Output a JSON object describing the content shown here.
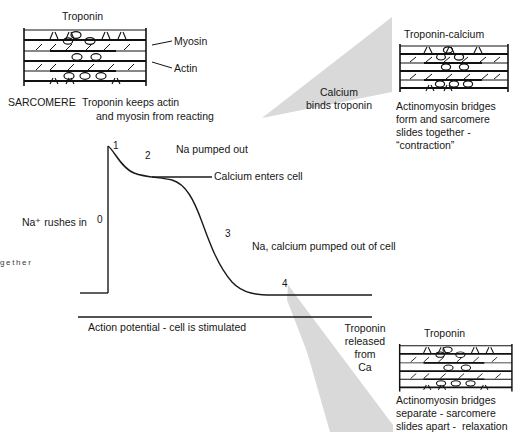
{
  "panels": {
    "top_left": {
      "name": "relaxed-sarcomere-panel",
      "heading": "Troponin",
      "label_myosin": "Myosin",
      "label_actin": "Actin",
      "caption_bold": "SARCOMERE",
      "caption_line1": "Troponin keeps actin",
      "caption_line2": "and myosin from reacting"
    },
    "top_right": {
      "name": "contracted-sarcomere-panel",
      "heading": "Troponin-calcium",
      "caption_line1": "Actinomyosin bridges",
      "caption_line2": "form and sarcomere",
      "caption_line3": "slides together -",
      "caption_line4": "“contraction”"
    },
    "bottom_right": {
      "name": "relaxing-sarcomere-panel",
      "heading": "Troponin",
      "caption_line1": "Actinomyosin bridges",
      "caption_line2": "separate - sarcomere",
      "caption_line3": "slides apart -  relaxation"
    }
  },
  "connectors": {
    "upper_label_line1": "Calcium",
    "upper_label_line2": "binds troponin",
    "lower_label_line1": "Troponin",
    "lower_label_line2": "released",
    "lower_label_line3": "from",
    "lower_label_line4": "Ca",
    "fill_color": "#d9d9d9"
  },
  "graph": {
    "name": "action-potential-graph",
    "axis_caption": "Action potential - cell is stimulated",
    "label_na_rushes_in": "Na⁺ rushes in",
    "label_na_pumped_out": "Na pumped out",
    "label_calcium_enters": "Calcium enters cell",
    "label_na_calcium_pumped_out": "Na, calcium pumped out of cell",
    "phases": [
      {
        "id": "0",
        "label": "0"
      },
      {
        "id": "1",
        "label": "1"
      },
      {
        "id": "2",
        "label": "2"
      },
      {
        "id": "3",
        "label": "3"
      },
      {
        "id": "4",
        "label": "4"
      }
    ]
  },
  "margin_note": {
    "text": "g\ne\nt\nh\ne\nr"
  }
}
